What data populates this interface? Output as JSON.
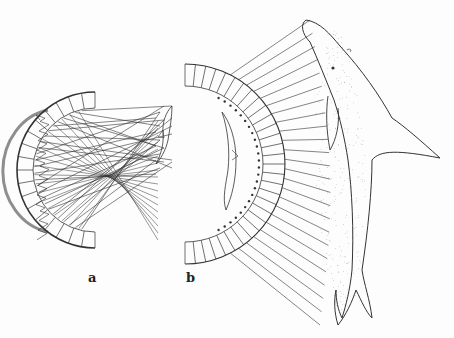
{
  "figure": {
    "panels": [
      {
        "label": "a",
        "description": "Semicircular receptor array with crossing ray lines from a small dolphin-shaped source; scrambled image"
      },
      {
        "label": "b",
        "description": "Semicircular receptor array with parallel rays from a large dolphin projecting a small focused inverted image"
      }
    ],
    "colors": {
      "ink": "#333333",
      "paper": "#fdfdfd"
    }
  }
}
